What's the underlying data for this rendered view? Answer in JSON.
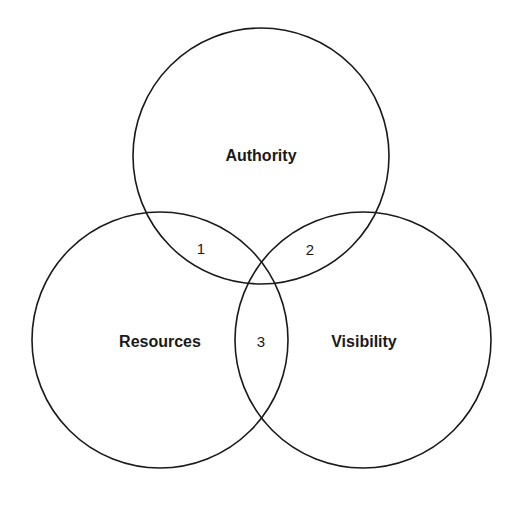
{
  "diagram": {
    "type": "venn",
    "sets": [
      {
        "id": "authority",
        "label": "Authority",
        "cx": 261,
        "cy": 156,
        "r": 128
      },
      {
        "id": "resources",
        "label": "Resources",
        "cx": 160,
        "cy": 340,
        "r": 128
      },
      {
        "id": "visibility",
        "label": "Visibility",
        "cx": 363,
        "cy": 340,
        "r": 128
      }
    ],
    "regions": [
      {
        "label": "1",
        "between": [
          "Authority",
          "Resources"
        ]
      },
      {
        "label": "2",
        "between": [
          "Authority",
          "Visibility"
        ]
      },
      {
        "label": "3",
        "between": [
          "Resources",
          "Visibility"
        ]
      }
    ],
    "stroke_color": "#1a1a1a",
    "background": "#ffffff"
  }
}
